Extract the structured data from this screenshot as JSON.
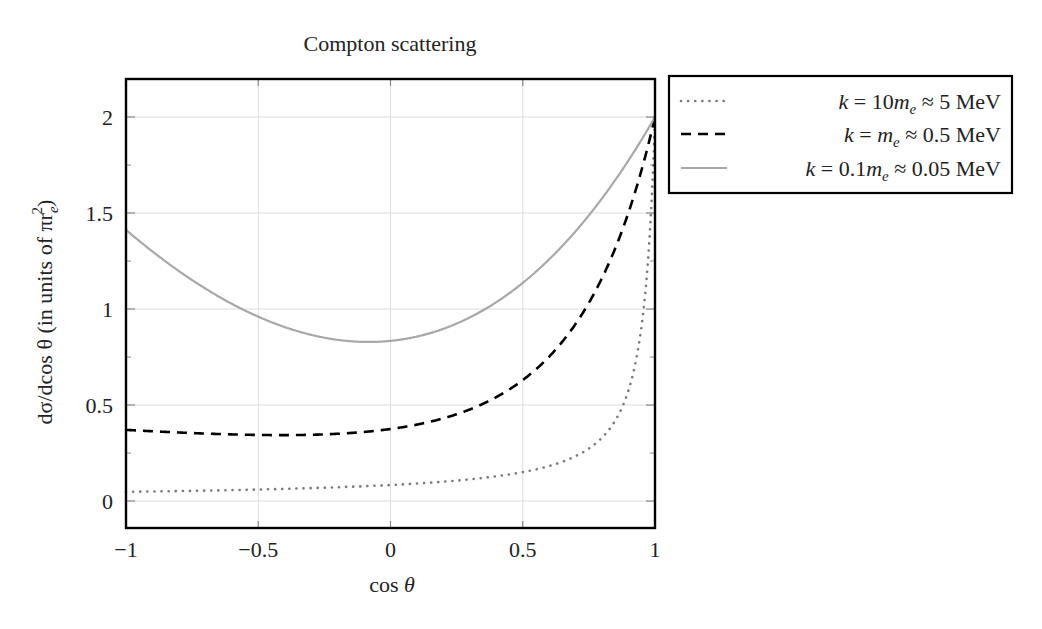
{
  "chart_data": {
    "type": "line",
    "title": "Compton scattering",
    "xlabel": "cos θ",
    "ylabel": "dσ/d cos θ (in units of πr_e²)",
    "xlim": [
      -1,
      1
    ],
    "ylim": [
      -0.14,
      2.2
    ],
    "xticks": [
      -1,
      -0.5,
      0,
      0.5,
      1
    ],
    "xtick_labels": [
      "−1",
      "−0.5",
      "0",
      "0.5",
      "1"
    ],
    "yticks": [
      0,
      0.5,
      1,
      1.5,
      2
    ],
    "ytick_labels": [
      "0",
      "0.5",
      "1",
      "1.5",
      "2"
    ],
    "y_minor_ticks": [
      0.25,
      0.75,
      1.25,
      1.75
    ],
    "grid": true,
    "legend_position": "outside-right-top",
    "x": [
      -1,
      -0.9,
      -0.8,
      -0.7,
      -0.6,
      -0.5,
      -0.4,
      -0.3,
      -0.2,
      -0.1,
      0,
      0.1,
      0.2,
      0.3,
      0.4,
      0.5,
      0.6,
      0.7,
      0.8,
      0.85,
      0.9,
      0.95,
      0.97,
      0.99,
      1
    ],
    "series": [
      {
        "name": "k = 10m_e ≈ 5 MeV",
        "kappa": 10,
        "style": "dotted",
        "color": "#7a7a7a",
        "values": [
          0.048,
          0.05,
          0.053,
          0.056,
          0.06,
          0.064,
          0.069,
          0.075,
          0.082,
          0.091,
          0.102,
          0.115,
          0.133,
          0.156,
          0.189,
          0.237,
          0.312,
          0.443,
          0.703,
          0.934,
          1.31,
          1.877,
          2.05,
          2.08,
          2.0
        ]
      },
      {
        "name": "k = m_e ≈ 0.5 MeV",
        "kappa": 1,
        "style": "dashed",
        "color": "#000000",
        "values": [
          0.37,
          0.359,
          0.352,
          0.348,
          0.347,
          0.349,
          0.354,
          0.363,
          0.377,
          0.397,
          0.424,
          0.461,
          0.51,
          0.575,
          0.661,
          0.775,
          0.927,
          1.13,
          1.405,
          1.573,
          1.768,
          1.992,
          2.092,
          2.183,
          2.0
        ]
      },
      {
        "name": "k = 0.1m_e ≈ 0.05 MeV",
        "kappa": 0.1,
        "style": "solid",
        "color": "#a8a8a8",
        "values": [
          1.412,
          1.283,
          1.167,
          1.066,
          0.981,
          0.912,
          0.86,
          0.826,
          0.81,
          0.812,
          0.834,
          0.875,
          0.937,
          1.02,
          1.125,
          1.253,
          1.405,
          1.582,
          1.784,
          1.895,
          2.013,
          2.138,
          2.19,
          2.244,
          2.0
        ]
      }
    ]
  },
  "title": "Compton scattering",
  "axes": {
    "xlabel_main": "cos",
    "xlabel_var": "θ",
    "ylabel": "dσ/dcos θ (in units of πr",
    "ylabel_sub": "e",
    "ylabel_sup": "2",
    "ylabel_close": ")"
  },
  "legend": {
    "entries": [
      {
        "lhs": "k",
        "eq": " = 10",
        "m": "m",
        "sub": "e",
        "rhs": " ≈ 5 MeV"
      },
      {
        "lhs": "k",
        "eq": " = ",
        "m": "m",
        "sub": "e",
        "rhs": " ≈ 0.5 MeV"
      },
      {
        "lhs": "k",
        "eq": " = 0.1",
        "m": "m",
        "sub": "e",
        "rhs": " ≈ 0.05 MeV"
      }
    ]
  }
}
